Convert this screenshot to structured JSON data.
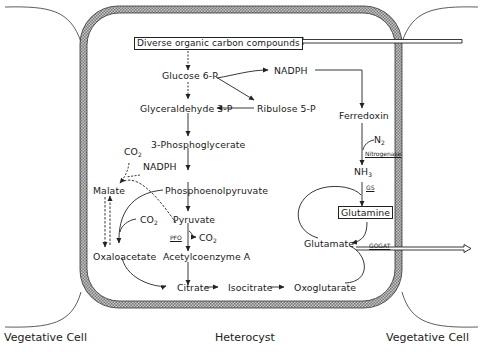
{
  "diagram": {
    "captions": {
      "left": "Vegetative Cell",
      "center": "Heterocyst",
      "right": "Vegetative Cell"
    },
    "nodes": {
      "diverse": "Diverse organic carbon compounds",
      "glucose6p": "Glucose 6-P",
      "nadph_top": "NADPH",
      "glyceraldehyde3p": "Glyceraldehyde 3-P",
      "ribulose5p": "Ribulose 5-P",
      "ferredoxin": "Ferredoxin",
      "phosphoglycerate": "3-Phosphoglycerate",
      "co2_top": "CO",
      "co2_top_sub": "2",
      "nadph_left": "NADPH",
      "malate": "Malate",
      "pep": "Phosphoenolpyruvate",
      "co2_mid": "CO",
      "co2_mid_sub": "2",
      "pyruvate": "Pyruvate",
      "co2_pfo": "CO",
      "co2_pfo_sub": "2",
      "oxaloacetate": "Oxaloacetate",
      "acetylcoa": "Acetylcoenzyme A",
      "citrate": "Citrate",
      "isocitrate": "Isocitrate",
      "oxoglutarate": "Oxoglutarate",
      "n2": "N",
      "n2_sub": "2",
      "nh3": "NH",
      "nh3_sub": "3",
      "glutamine": "Glutamine",
      "glutamate": "Glutamate"
    },
    "enzymes": {
      "pfo": "PFO",
      "nitrogenase": "Nitrogenase",
      "gs": "GS",
      "gogat": "GOGAT"
    }
  }
}
